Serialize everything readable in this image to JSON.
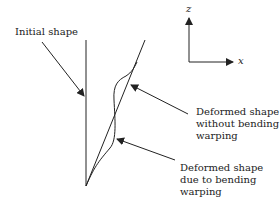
{
  "labels": {
    "initial": "Initial shape",
    "deformed_no_warp": [
      "Deformed shape",
      "without bending",
      "warping"
    ],
    "deformed_warp": [
      "Deformed shape",
      "due to bending",
      "warping"
    ]
  },
  "axes": {
    "z": "z",
    "x": "x"
  },
  "colors": {
    "line": "#222222",
    "background": "#ffffff"
  }
}
